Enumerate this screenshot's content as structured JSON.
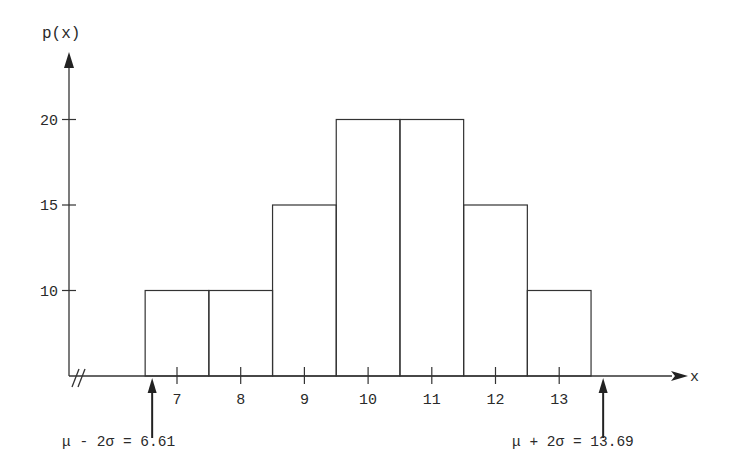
{
  "chart_data": {
    "type": "bar",
    "title": "",
    "xlabel": "x",
    "ylabel": "p(x)",
    "categories": [
      "7",
      "8",
      "9",
      "10",
      "11",
      "12",
      "13"
    ],
    "values": [
      10,
      10,
      15,
      20,
      20,
      15,
      10
    ],
    "yticks": [
      "10",
      "15",
      "20"
    ],
    "ylim": [
      5,
      24
    ],
    "xlim": [
      5.5,
      14.5
    ],
    "axis_break": "//",
    "grid": false,
    "legend": null,
    "annotations": [
      {
        "label": "μ - 2σ = 6.61",
        "x": 6.61
      },
      {
        "label": "μ + 2σ = 13.69",
        "x": 13.69
      }
    ]
  },
  "colors": {
    "line": "#333333",
    "background": "#ffffff"
  }
}
